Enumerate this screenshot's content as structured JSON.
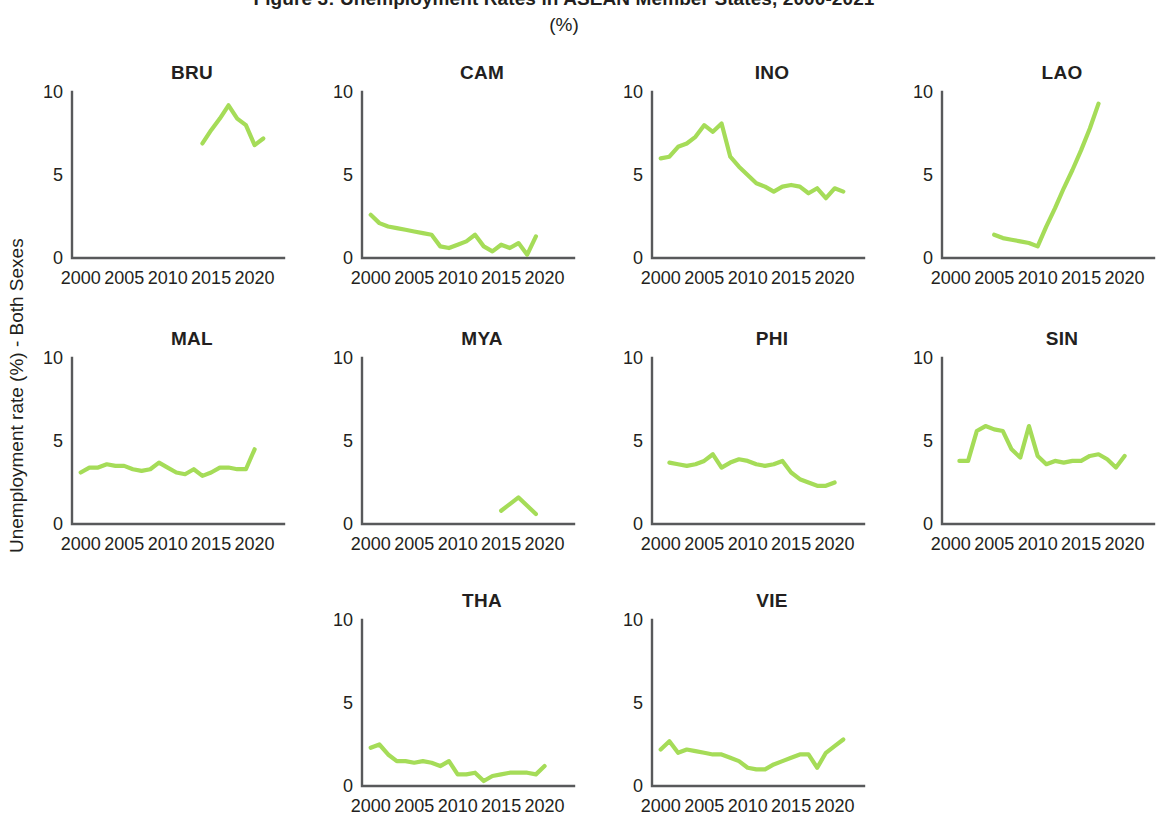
{
  "figure": {
    "title": "Figure 3: Unemployment Rates in ASEAN Member States, 2000-2021",
    "subtitle": "(%)",
    "y_axis_title": "Unemployment rate (%) - Both Sexes",
    "line_color": "#A5DC58",
    "axis_color": "#58595b",
    "text_color": "#231f20"
  },
  "chart_data": {
    "type": "line",
    "title": "Figure 3: Unemployment Rates in ASEAN Member States, 2000-2021",
    "subtitle": "(%)",
    "xlabel": "",
    "ylabel": "Unemployment rate (%) - Both Sexes",
    "xlim": [
      1999,
      2022
    ],
    "ylim": [
      0,
      10
    ],
    "xticks": [
      2000,
      2005,
      2010,
      2015,
      2020
    ],
    "yticks": [
      0,
      5,
      10
    ],
    "xtick_labels": [
      "2000",
      "2005",
      "2010",
      "2015",
      "2020"
    ],
    "ytick_labels": [
      "0",
      "5",
      "10"
    ],
    "grid": false,
    "legend": "none",
    "layout": "small-multiples 4x3",
    "panels": [
      {
        "name": "BRU",
        "row": 0,
        "col": 0,
        "x": [
          2014,
          2015,
          2016,
          2017,
          2018,
          2019,
          2020,
          2021
        ],
        "y": [
          6.9,
          7.7,
          8.4,
          9.2,
          8.4,
          8.0,
          6.8,
          7.2
        ]
      },
      {
        "name": "CAM",
        "row": 0,
        "col": 1,
        "x": [
          2000,
          2001,
          2002,
          2003,
          2004,
          2005,
          2006,
          2007,
          2008,
          2009,
          2010,
          2011,
          2012,
          2013,
          2014,
          2015,
          2016,
          2017,
          2018,
          2019
        ],
        "y": [
          2.6,
          2.1,
          1.9,
          1.8,
          1.7,
          1.6,
          1.5,
          1.4,
          0.7,
          0.6,
          0.8,
          1.0,
          1.4,
          0.7,
          0.4,
          0.8,
          0.6,
          0.9,
          0.2,
          1.3
        ]
      },
      {
        "name": "INO",
        "row": 0,
        "col": 2,
        "x": [
          2000,
          2001,
          2002,
          2003,
          2004,
          2005,
          2006,
          2007,
          2008,
          2009,
          2010,
          2011,
          2012,
          2013,
          2014,
          2015,
          2016,
          2017,
          2018,
          2019,
          2020,
          2021
        ],
        "y": [
          6.0,
          6.1,
          6.7,
          6.9,
          7.3,
          8.0,
          7.6,
          8.1,
          6.1,
          5.5,
          5.0,
          4.5,
          4.3,
          4.0,
          4.3,
          4.4,
          4.3,
          3.9,
          4.2,
          3.6,
          4.2,
          4.0
        ]
      },
      {
        "name": "LAO",
        "row": 0,
        "col": 3,
        "x": [
          2005,
          2006,
          2007,
          2008,
          2009,
          2010,
          2011,
          2012,
          2013,
          2014,
          2015,
          2016,
          2017
        ],
        "y": [
          1.4,
          1.2,
          1.1,
          1.0,
          0.9,
          0.7,
          1.9,
          3.0,
          4.2,
          5.3,
          6.5,
          7.8,
          9.3
        ]
      },
      {
        "name": "MAL",
        "row": 1,
        "col": 0,
        "x": [
          2000,
          2001,
          2002,
          2003,
          2004,
          2005,
          2006,
          2007,
          2008,
          2009,
          2010,
          2011,
          2012,
          2013,
          2014,
          2015,
          2016,
          2017,
          2018,
          2019,
          2020
        ],
        "y": [
          3.1,
          3.4,
          3.4,
          3.6,
          3.5,
          3.5,
          3.3,
          3.2,
          3.3,
          3.7,
          3.4,
          3.1,
          3.0,
          3.3,
          2.9,
          3.1,
          3.4,
          3.4,
          3.3,
          3.3,
          4.5
        ]
      },
      {
        "name": "MYA",
        "row": 1,
        "col": 1,
        "x": [
          2015,
          2016,
          2017,
          2018,
          2019
        ],
        "y": [
          0.8,
          1.2,
          1.6,
          1.1,
          0.6
        ]
      },
      {
        "name": "PHI",
        "row": 1,
        "col": 2,
        "x": [
          2001,
          2002,
          2003,
          2004,
          2005,
          2006,
          2007,
          2008,
          2009,
          2010,
          2011,
          2012,
          2013,
          2014,
          2015,
          2016,
          2017,
          2018,
          2019,
          2020
        ],
        "y": [
          3.7,
          3.6,
          3.5,
          3.6,
          3.8,
          4.2,
          3.4,
          3.7,
          3.9,
          3.8,
          3.6,
          3.5,
          3.6,
          3.8,
          3.1,
          2.7,
          2.5,
          2.3,
          2.3,
          2.5
        ]
      },
      {
        "name": "SIN",
        "row": 1,
        "col": 3,
        "x": [
          2001,
          2002,
          2003,
          2004,
          2005,
          2006,
          2007,
          2008,
          2009,
          2010,
          2011,
          2012,
          2013,
          2014,
          2015,
          2016,
          2017,
          2018,
          2019,
          2020
        ],
        "y": [
          3.8,
          3.8,
          5.6,
          5.9,
          5.7,
          5.6,
          4.5,
          4.0,
          5.9,
          4.1,
          3.6,
          3.8,
          3.7,
          3.8,
          3.8,
          4.1,
          4.2,
          3.9,
          3.4,
          4.1
        ]
      },
      {
        "name": "THA",
        "row": 2,
        "col": 1,
        "x": [
          2000,
          2001,
          2002,
          2003,
          2004,
          2005,
          2006,
          2007,
          2008,
          2009,
          2010,
          2011,
          2012,
          2013,
          2014,
          2015,
          2016,
          2017,
          2018,
          2019,
          2020
        ],
        "y": [
          2.3,
          2.5,
          1.9,
          1.5,
          1.5,
          1.4,
          1.5,
          1.4,
          1.2,
          1.5,
          0.7,
          0.7,
          0.8,
          0.3,
          0.6,
          0.7,
          0.8,
          0.8,
          0.8,
          0.7,
          1.2
        ]
      },
      {
        "name": "VIE",
        "row": 2,
        "col": 2,
        "x": [
          2000,
          2001,
          2002,
          2003,
          2004,
          2005,
          2006,
          2007,
          2008,
          2009,
          2010,
          2011,
          2012,
          2013,
          2014,
          2015,
          2016,
          2017,
          2018,
          2019,
          2020,
          2021
        ],
        "y": [
          2.2,
          2.7,
          2.0,
          2.2,
          2.1,
          2.0,
          1.9,
          1.9,
          1.7,
          1.5,
          1.1,
          1.0,
          1.0,
          1.3,
          1.5,
          1.7,
          1.9,
          1.9,
          1.1,
          2.0,
          2.4,
          2.8
        ]
      }
    ]
  }
}
